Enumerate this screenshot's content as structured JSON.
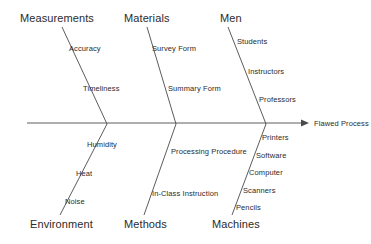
{
  "diagram": {
    "type": "fishbone-ishikawa",
    "effect": {
      "label": "Flawed Process",
      "x": 314,
      "y": 120
    },
    "spine": {
      "x1": 27,
      "y1": 123,
      "x2": 307,
      "y2": 123,
      "color": "#4a4a4a"
    },
    "categories": [
      {
        "name": "Measurements",
        "side": "top",
        "label_x": 20,
        "label_y": 13,
        "bone": {
          "x1": 62,
          "y1": 27,
          "x2": 107,
          "y2": 124
        },
        "causes": [
          {
            "text": "Accuracy",
            "x": 69,
            "y": 45
          },
          {
            "text": "Timeliness",
            "x": 83,
            "y": 85
          }
        ]
      },
      {
        "name": "Materials",
        "side": "top",
        "label_x": 124,
        "label_y": 13,
        "bone": {
          "x1": 147,
          "y1": 27,
          "x2": 176,
          "y2": 124
        },
        "causes": [
          {
            "text": "Survey Form",
            "x": 152,
            "y": 45
          },
          {
            "text": "Summary Form",
            "x": 168,
            "y": 85
          }
        ]
      },
      {
        "name": "Men",
        "side": "top",
        "label_x": 220,
        "label_y": 13,
        "bone": {
          "x1": 228,
          "y1": 27,
          "x2": 266,
          "y2": 124
        },
        "causes": [
          {
            "text": "Students",
            "x": 237,
            "y": 38
          },
          {
            "text": "Instructors",
            "x": 248,
            "y": 68
          },
          {
            "text": "Professors",
            "x": 259,
            "y": 96
          }
        ]
      },
      {
        "name": "Environment",
        "side": "bottom",
        "label_x": 30,
        "label_y": 219,
        "bone": {
          "x1": 107,
          "y1": 124,
          "x2": 60,
          "y2": 215
        },
        "causes": [
          {
            "text": "Humidity",
            "x": 87,
            "y": 141
          },
          {
            "text": "Heat",
            "x": 76,
            "y": 170
          },
          {
            "text": "Noise",
            "x": 65,
            "y": 198
          }
        ]
      },
      {
        "name": "Methods",
        "side": "bottom",
        "label_x": 124,
        "label_y": 219,
        "bone": {
          "x1": 176,
          "y1": 124,
          "x2": 144,
          "y2": 215
        },
        "causes": [
          {
            "text": "Processing Procedure",
            "x": 171,
            "y": 148
          },
          {
            "text": "In-Class Instruction",
            "x": 152,
            "y": 190
          }
        ]
      },
      {
        "name": "Machines",
        "side": "bottom",
        "label_x": 212,
        "label_y": 219,
        "bone": {
          "x1": 266,
          "y1": 124,
          "x2": 232,
          "y2": 215
        },
        "causes": [
          {
            "text": "Printers",
            "x": 262,
            "y": 134
          },
          {
            "text": "Software",
            "x": 256,
            "y": 152
          },
          {
            "text": "Computer",
            "x": 249,
            "y": 169
          },
          {
            "text": "Scanners",
            "x": 243,
            "y": 187
          },
          {
            "text": "Pencils",
            "x": 236,
            "y": 204
          }
        ]
      }
    ]
  }
}
